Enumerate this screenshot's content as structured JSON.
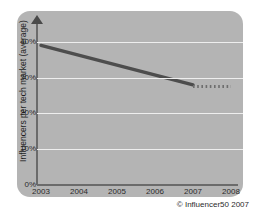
{
  "chart_data": {
    "type": "line",
    "title": "",
    "xlabel": "",
    "ylabel": "Influencers per tech market (average)",
    "categories": [
      "2003",
      "2004",
      "2005",
      "2006",
      "2007",
      "2008"
    ],
    "ylim": [
      0,
      45
    ],
    "xlim": [
      2003,
      2008
    ],
    "grid": true,
    "legend": false,
    "ytick_labels": [
      "0%",
      "10%",
      "20%",
      "30%",
      "40%"
    ],
    "ytick_values": [
      0,
      10,
      20,
      30,
      40
    ],
    "series": [
      {
        "name": "Actual",
        "style": "solid",
        "color": "#4d4d4d",
        "x": [
          2003,
          2007
        ],
        "values": [
          39,
          28
        ]
      },
      {
        "name": "Forecast",
        "style": "dotted",
        "color": "#6e6e6e",
        "x": [
          2007,
          2008
        ],
        "values": [
          27.5,
          27.5
        ]
      }
    ],
    "annotations": []
  },
  "figure": {
    "credit": "© Influencer50 2007",
    "panel_color": "#b4b4b4",
    "gridline_color": "#eeeeee",
    "axis_color": "#6b6b6b",
    "background": "#ffffff"
  },
  "icons": {
    "y_axis_arrow": "arrow-up-icon"
  }
}
